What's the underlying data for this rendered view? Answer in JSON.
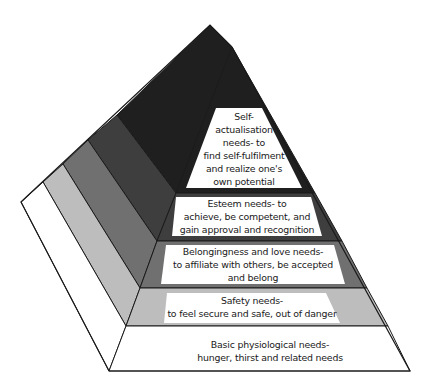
{
  "diagram": {
    "type": "pyramid",
    "title": "",
    "colors": {
      "self_actualisation": "#1f1f1f",
      "esteem": "#3e3e3e",
      "belonging": "#707070",
      "safety": "#bdbdbd",
      "physiological": "#ffffff",
      "outline": "#1a1a1a",
      "label_box": "#ffffff"
    },
    "levels": [
      {
        "id": "self_actualisation",
        "order": 5,
        "lines": [
          "Self-",
          "actualisation",
          "needs- to",
          "find self-fulfilment",
          "and realize one's",
          "own potential"
        ]
      },
      {
        "id": "esteem",
        "order": 4,
        "lines": [
          "Esteem needs- to",
          "achieve, be competent, and",
          "gain approval and recognition"
        ]
      },
      {
        "id": "belonging",
        "order": 3,
        "lines": [
          "Belongingness and love needs-",
          "to affiliate with others, be accepted",
          "and belong"
        ]
      },
      {
        "id": "safety",
        "order": 2,
        "lines": [
          "Safety needs-",
          "to feel secure and safe, out of danger"
        ]
      },
      {
        "id": "physiological",
        "order": 1,
        "lines": [
          "Basic physiological needs-",
          "hunger, thirst and related needs"
        ]
      }
    ]
  }
}
